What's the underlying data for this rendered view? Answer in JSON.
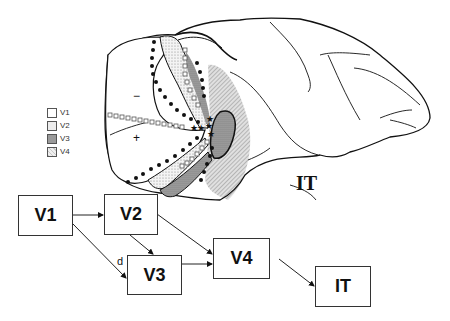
{
  "brain": {
    "region_label": "IT",
    "minus_sign": "−",
    "plus_sign": "+"
  },
  "legend": {
    "items": [
      {
        "label": "V1",
        "pattern": "blank",
        "color": "#ffffff"
      },
      {
        "label": "V2",
        "pattern": "light-stipple",
        "color": "#e4e4e4"
      },
      {
        "label": "V3",
        "pattern": "dark-stipple",
        "color": "#9a9a9a"
      },
      {
        "label": "V4",
        "pattern": "hatched",
        "color": "#c8c8c8"
      }
    ]
  },
  "flow": {
    "nodes": [
      {
        "id": "V1",
        "label": "V1"
      },
      {
        "id": "V2",
        "label": "V2"
      },
      {
        "id": "V3",
        "label": "V3"
      },
      {
        "id": "V4",
        "label": "V4"
      },
      {
        "id": "IT",
        "label": "IT"
      }
    ],
    "edges": [
      {
        "from": "V1",
        "to": "V2",
        "label": ""
      },
      {
        "from": "V1",
        "to": "V3",
        "label": "d"
      },
      {
        "from": "V2",
        "to": "V3",
        "label": ""
      },
      {
        "from": "V2",
        "to": "V4",
        "label": ""
      },
      {
        "from": "V3",
        "to": "V4",
        "label": ""
      },
      {
        "from": "V4",
        "to": "IT",
        "label": ""
      }
    ],
    "edge_label_d": "d"
  }
}
